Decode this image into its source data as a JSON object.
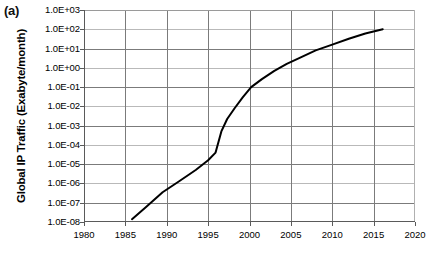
{
  "figure": {
    "panel_label": "(a)",
    "ylabel": "Global IP Traffic (Exabyte/month)"
  },
  "chart_data": {
    "type": "line",
    "title": "",
    "xlabel": "",
    "ylabel": "Global IP Traffic (Exabyte/month)",
    "yscale": "log",
    "xlim": [
      1980,
      2020
    ],
    "ylim": [
      1e-08,
      1000.0
    ],
    "grid": true,
    "legend": null,
    "xticks": [
      1980,
      1985,
      1990,
      1995,
      2000,
      2005,
      2010,
      2015,
      2020
    ],
    "xtick_labels": [
      "1980",
      "1985",
      "1990",
      "1995",
      "2000",
      "2005",
      "2010",
      "2015",
      "2020"
    ],
    "yticks": [
      1000.0,
      100.0,
      10.0,
      1.0,
      0.1,
      0.01,
      0.001,
      0.0001,
      1e-05,
      1e-06,
      1e-07,
      1e-08
    ],
    "ytick_labels": [
      "1.0E+03",
      "1.0E+02",
      "1.0E+01",
      "1.0E+00",
      "1.0E-01",
      "1.0E-02",
      "1.0E-03",
      "1.0E-04",
      "1.0E-05",
      "1.0E-06",
      "1.0E-07",
      "1.0E-08"
    ],
    "series": [
      {
        "name": "Global IP Traffic",
        "color": "#000000",
        "x": [
          1985.8,
          1987.5,
          1989.5,
          1991.5,
          1993.5,
          1995.0,
          1995.9,
          1996.6,
          1997.3,
          1998.2,
          1999.2,
          2000.2,
          2001.5,
          2003.0,
          2004.5,
          2006.0,
          2008.0,
          2010.0,
          2012.0,
          2014.0,
          2016.1
        ],
        "y": [
          1.4e-08,
          6e-08,
          3.5e-07,
          1.3e-06,
          5e-06,
          1.6e-05,
          4e-05,
          0.0005,
          0.0022,
          0.008,
          0.03,
          0.1,
          0.26,
          0.7,
          1.6,
          3.2,
          8.0,
          16.0,
          32.0,
          60.0,
          100.0
        ]
      }
    ]
  }
}
